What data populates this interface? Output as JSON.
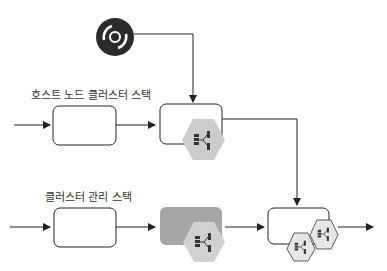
{
  "diagram": {
    "labels": {
      "host_node_stack": "호스트 노드 클러스터 스택",
      "cluster_mgmt_stack": "클러스터 관리 스택"
    },
    "icons": {
      "source": "disc-icon",
      "node_group": "hexagon-node-icon"
    },
    "colors": {
      "line": "#222222",
      "hex_fill": "#cccccc",
      "hex_fill_light": "#e6e6e6",
      "gray_box": "#a6a6a6",
      "disc": "#2b2b2b"
    }
  }
}
